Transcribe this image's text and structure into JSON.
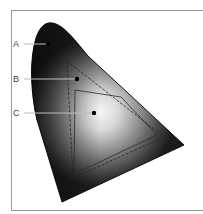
{
  "diagram": {
    "type": "chromaticity-gamut-diagram",
    "labels": [
      {
        "id": "A",
        "text": "A",
        "x": 13,
        "y": 39
      },
      {
        "id": "B",
        "text": "B",
        "x": 13,
        "y": 74
      },
      {
        "id": "C",
        "text": "C",
        "x": 13,
        "y": 108
      }
    ],
    "colors": {
      "frame": "#9a9a9a",
      "shape_dark": "#1a1a1a",
      "shape_light": "#f4f4f4",
      "outline": "#111111",
      "leader": "#bdbdbd"
    }
  }
}
